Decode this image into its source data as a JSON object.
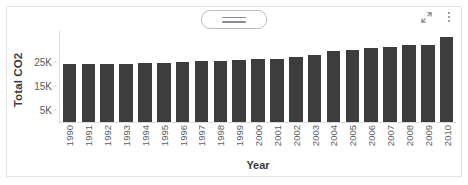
{
  "toolbar": {
    "menu_button_name": "chart-menu-button",
    "menu_icon": "hamburger-icon",
    "expand_icon": "expand-arrows-icon",
    "more_icon": "kebab-menu-icon"
  },
  "chart_data": {
    "type": "bar",
    "title": "",
    "xlabel": "Year",
    "ylabel": "Total CO2",
    "ylim": [
      0,
      38000
    ],
    "yticks": [
      5000,
      15000,
      25000
    ],
    "ytick_labels": [
      "5K",
      "15K",
      "25K"
    ],
    "grid": false,
    "legend": "none",
    "bar_color": "#3d3d3d",
    "categories": [
      "1990",
      "1991",
      "1992",
      "1993",
      "1994",
      "1995",
      "1996",
      "1997",
      "1998",
      "1999",
      "2000",
      "2001",
      "2002",
      "2003",
      "2004",
      "2005",
      "2006",
      "2007",
      "2008",
      "2009",
      "2010"
    ],
    "values": [
      24200,
      24300,
      24200,
      24300,
      24600,
      24600,
      25200,
      25600,
      25600,
      25700,
      26500,
      26400,
      27100,
      27900,
      29600,
      30200,
      30900,
      31400,
      32200,
      32000,
      35700
    ]
  }
}
